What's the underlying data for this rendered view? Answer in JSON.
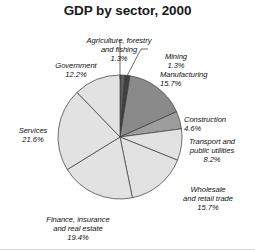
{
  "chart_data": {
    "type": "pie",
    "title": "GDP by sector, 2000",
    "xlabel": "",
    "ylabel": "",
    "legend_position": "none",
    "grid": false,
    "start_angle_deg": 0,
    "direction": "clockwise",
    "units": "percent",
    "categories": [
      "Agriculture, forestry and fishing",
      "Mining",
      "Manufacturing",
      "Construction",
      "Transport and public utilities",
      "Wholesale and retail trade",
      "Finance, insurance and real estate",
      "Services",
      "Government"
    ],
    "values": [
      1.3,
      1.3,
      15.7,
      4.6,
      8.2,
      15.7,
      19.4,
      21.6,
      12.2
    ],
    "slices": [
      {
        "label": "Agriculture, forestry\nand fishing",
        "value_text": "1.3%",
        "value": 1.3,
        "color": "#5d5d5d"
      },
      {
        "label": "Mining",
        "value_text": "1.3%",
        "value": 1.3,
        "color": "#3f3f3f"
      },
      {
        "label": "Manufacturing",
        "value_text": "15.7%",
        "value": 15.7,
        "color": "#8a8a8a"
      },
      {
        "label": "Construction",
        "value_text": "4.6%",
        "value": 4.6,
        "color": "#9d9d9d"
      },
      {
        "label": "Transport and\npublic utilities",
        "value_text": "8.2%",
        "value": 8.2,
        "color": "#e2e2e2"
      },
      {
        "label": "Wholesale\nand retail trade",
        "value_text": "15.7%",
        "value": 15.7,
        "color": "#e2e2e2"
      },
      {
        "label": "Finance, insurance\nand real estate",
        "value_text": "19.4%",
        "value": 19.4,
        "color": "#e2e2e2"
      },
      {
        "label": "Services",
        "value_text": "21.6%",
        "value": 21.6,
        "color": "#e2e2e2"
      },
      {
        "label": "Government",
        "value_text": "12.2%",
        "value": 12.2,
        "color": "#e2e2e2"
      }
    ],
    "colors": {
      "light_slice": "#e2e2e2",
      "manufacturing": "#8a8a8a",
      "construction": "#9d9d9d",
      "agriculture": "#5d5d5d",
      "mining": "#3f3f3f",
      "outline": "#3a3a3a",
      "title": "#1a1a1a",
      "label": "#111111",
      "background": "#ffffff"
    }
  },
  "labels": {
    "agriculture": {
      "name": "Agriculture, forestry\nand fishing",
      "pct": "1.3%"
    },
    "mining": {
      "name": "Mining",
      "pct": "1.3%"
    },
    "manufacturing": {
      "name": "Manufacturing",
      "pct": "15.7%"
    },
    "construction": {
      "name": "Construction",
      "pct": "4.6%"
    },
    "transport": {
      "name": "Transport and\npublic utilities",
      "pct": "8.2%"
    },
    "wholesale": {
      "name": "Wholesale\nand retail trade",
      "pct": "15.7%"
    },
    "finance": {
      "name": "Finance, insurance\nand real estate",
      "pct": "19.4%"
    },
    "services": {
      "name": "Services",
      "pct": "21.6%"
    },
    "government": {
      "name": "Government",
      "pct": "12.2%"
    }
  }
}
